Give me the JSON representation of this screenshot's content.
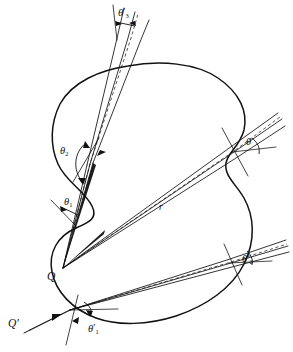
{
  "figure": {
    "type": "optical-ray-diagram",
    "background_color": "#ffffff",
    "stroke_color": "#111111",
    "labels": {
      "source_q": "Q",
      "source_q_prime": "Q′",
      "radius": "r",
      "theta_plain": "θ",
      "theta_1": "θ",
      "theta_1_sub": "1",
      "theta_2": "θ",
      "theta_2_sub": "2",
      "theta_prime_1": "θ",
      "theta_prime_1_sub": "1",
      "theta_prime_2": "θ",
      "theta_prime_2_sub": "2",
      "theta_prime_3": "θ",
      "theta_prime_3_sub": "3",
      "prime_mark": "′"
    }
  }
}
